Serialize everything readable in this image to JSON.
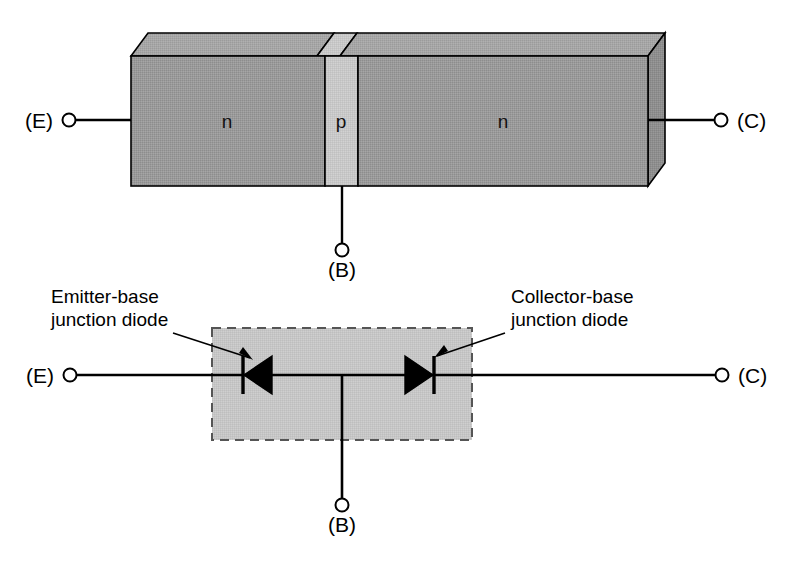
{
  "figure": {
    "background_color": "#ffffff",
    "line_color": "#000000"
  },
  "colors": {
    "n_region_fill": "#9a9a9a",
    "p_region_fill": "#c8c8c8",
    "top_face_fill": "#a4a4a4",
    "p_top_face_fill": "#cfcfcf",
    "right_face_fill": "#8e8e8e",
    "dashed_box_fill": "#c6c6c6",
    "dashed_box_stroke": "#555555",
    "outline": "#000000"
  },
  "structure_diagram": {
    "name": "npn-block-structure",
    "regions": [
      {
        "id": "emitter",
        "label": "n"
      },
      {
        "id": "base",
        "label": "p"
      },
      {
        "id": "collector",
        "label": "n"
      }
    ],
    "terminals": [
      {
        "id": "emitter",
        "label": "(E)",
        "position": "left"
      },
      {
        "id": "base",
        "label": "(B)",
        "position": "bottom"
      },
      {
        "id": "collector",
        "label": "(C)",
        "position": "right"
      }
    ]
  },
  "equivalent_diagram": {
    "name": "two-diode-equivalent",
    "terminals": [
      {
        "id": "emitter",
        "label": "(E)",
        "position": "left"
      },
      {
        "id": "base",
        "label": "(B)",
        "position": "bottom"
      },
      {
        "id": "collector",
        "label": "(C)",
        "position": "right"
      }
    ],
    "annotations": [
      {
        "id": "emitter-base-diode",
        "line1": "Emitter-base",
        "line2": "junction diode",
        "side": "left",
        "arrow_to": "left-diode"
      },
      {
        "id": "collector-base-diode",
        "line1": "Collector-base",
        "line2": "junction diode",
        "side": "right",
        "arrow_to": "right-diode"
      }
    ],
    "diodes": [
      {
        "id": "left-diode",
        "name": "emitter-base-junction-diode",
        "direction": "points-left",
        "cathode_side": "left"
      },
      {
        "id": "right-diode",
        "name": "collector-base-junction-diode",
        "direction": "points-right",
        "cathode_side": "right"
      }
    ]
  }
}
